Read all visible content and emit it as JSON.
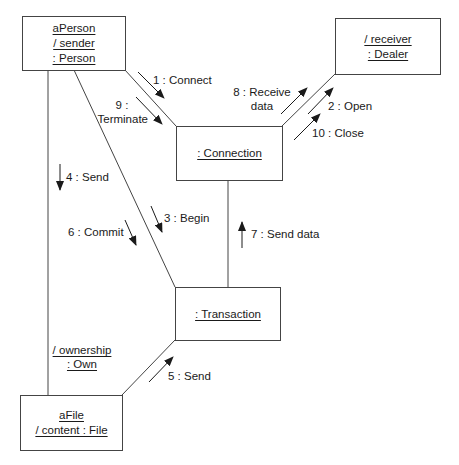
{
  "diagram": {
    "type": "UML collaboration diagram",
    "objects": {
      "person": {
        "lines": [
          "aPerson",
          "/ sender",
          ": Person"
        ]
      },
      "dealer": {
        "lines": [
          "/ receiver",
          ": Dealer"
        ]
      },
      "connection": {
        "lines": [
          ": Connection"
        ]
      },
      "transaction": {
        "lines": [
          ": Transaction"
        ]
      },
      "file": {
        "lines": [
          "aFile",
          "/ content : File"
        ]
      }
    },
    "links": {
      "ownership": {
        "lines": [
          "/ ownership",
          ": Own"
        ],
        "from": "aPerson",
        "to": "aFile"
      }
    },
    "messages": {
      "m1": {
        "text": "1 : Connect",
        "from": "aPerson",
        "to": ":Connection"
      },
      "m2": {
        "text": "2 : Open",
        "from": ":Connection",
        "to": "Dealer"
      },
      "m3": {
        "text": "3 : Begin",
        "from": "aPerson",
        "to": ":Transaction"
      },
      "m4": {
        "text": "4 : Send",
        "from": "aPerson",
        "to": "aFile"
      },
      "m5": {
        "text": "5 : Send",
        "from": "aFile",
        "to": ":Transaction"
      },
      "m6": {
        "text": "6 : Commit",
        "from": "aPerson",
        "to": ":Transaction"
      },
      "m7": {
        "text": "7 : Send data",
        "from": ":Transaction",
        "to": ":Connection"
      },
      "m8": {
        "line1": "8 : Receive",
        "line2": "data",
        "from": ":Connection",
        "to": "Dealer"
      },
      "m9": {
        "line1": "9 :",
        "line2": "Terminate",
        "from": "aPerson",
        "to": ":Connection"
      },
      "m10": {
        "text": "10 : Close",
        "from": ":Connection",
        "to": "Dealer"
      }
    },
    "colors": {
      "line": "#444444",
      "text": "#1a1a1a",
      "background": "#ffffff"
    }
  }
}
